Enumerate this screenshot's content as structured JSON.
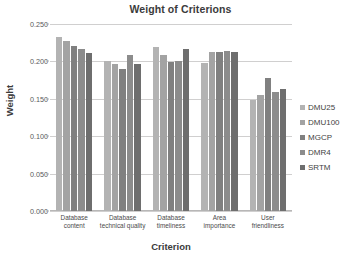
{
  "chart_data": {
    "type": "bar",
    "title": "Weight of Criterions",
    "xlabel": "Criterion",
    "ylabel": "Weight",
    "ylim": [
      0.0,
      0.25
    ],
    "yticks": [
      "0.000",
      "0.050",
      "0.100",
      "0.150",
      "0.200",
      "0.250"
    ],
    "ytick_values": [
      0.0,
      0.05,
      0.1,
      0.15,
      0.2,
      0.25
    ],
    "grid": true,
    "legend_position": "right",
    "categories": [
      "Database content",
      "Database technical quality",
      "Database timeliness",
      "Area importance",
      "User friendliness"
    ],
    "series": [
      {
        "name": "DMU25",
        "color": "#b3b3b3",
        "values": [
          0.232,
          0.201,
          0.219,
          0.198,
          0.148
        ]
      },
      {
        "name": "DMU100",
        "color": "#a3a3a3",
        "values": [
          0.227,
          0.196,
          0.208,
          0.213,
          0.155
        ]
      },
      {
        "name": "MGCP",
        "color": "#808080",
        "values": [
          0.221,
          0.19,
          0.199,
          0.213,
          0.178
        ]
      },
      {
        "name": "DMR4",
        "color": "#8c8c8c",
        "values": [
          0.217,
          0.209,
          0.2,
          0.214,
          0.159
        ]
      },
      {
        "name": "SRTM",
        "color": "#6e6e6e",
        "values": [
          0.211,
          0.197,
          0.217,
          0.213,
          0.163
        ]
      }
    ]
  }
}
